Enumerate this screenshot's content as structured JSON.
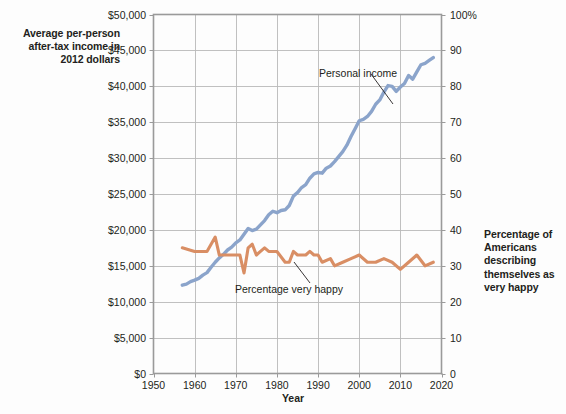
{
  "captions": {
    "left": "Average per-person after-tax income in 2012 dollars",
    "right": "Percentage of Americans describing themselves as very happy"
  },
  "annotations": {
    "personal_income": "Personal income",
    "very_happy": "Percentage very happy"
  },
  "colors": {
    "income_line": "#8ba4cb",
    "happy_line": "#d98e64",
    "grid": "#b9b9b9",
    "frame": "#9a9a9a",
    "text": "#231f20",
    "background": "#fdfdfd"
  },
  "chart_data": {
    "type": "line",
    "title": "",
    "xlabel": "Year",
    "ylabel": "Average per-person after-tax income in 2012 dollars",
    "y2label": "Percentage of Americans describing themselves as very happy",
    "xlim": [
      1950,
      2020
    ],
    "ylim": [
      0,
      50000
    ],
    "y2lim": [
      0,
      100
    ],
    "xticks": [
      1950,
      1960,
      1970,
      1980,
      1990,
      2000,
      2010,
      2020
    ],
    "xticklabels": [
      "1950",
      "1960",
      "1970",
      "1980",
      "1990",
      "2000",
      "2010",
      "2020"
    ],
    "yticks": [
      0,
      5000,
      10000,
      15000,
      20000,
      25000,
      30000,
      35000,
      40000,
      45000,
      50000
    ],
    "yticklabels": [
      "$0",
      "$5,000",
      "$10,000",
      "$15,000",
      "$20,000",
      "$25,000",
      "$30,000",
      "$35,000",
      "$40,000",
      "$45,000",
      "$50,000"
    ],
    "y2ticks": [
      0,
      10,
      20,
      30,
      40,
      50,
      60,
      70,
      80,
      90,
      100
    ],
    "y2ticklabels": [
      "0",
      "10",
      "20",
      "30",
      "40",
      "50",
      "60",
      "70",
      "80",
      "90",
      "100%"
    ],
    "grid": true,
    "legend": "annotations-inline",
    "series": [
      {
        "name": "Personal income",
        "axis": "left",
        "unit": "2012 dollars",
        "color": "#8ba4cb",
        "x": [
          1957,
          1958,
          1959,
          1960,
          1961,
          1962,
          1963,
          1964,
          1965,
          1966,
          1967,
          1968,
          1969,
          1970,
          1971,
          1972,
          1973,
          1974,
          1975,
          1976,
          1977,
          1978,
          1979,
          1980,
          1981,
          1982,
          1983,
          1984,
          1985,
          1986,
          1987,
          1988,
          1989,
          1990,
          1991,
          1992,
          1993,
          1994,
          1995,
          1996,
          1997,
          1998,
          1999,
          2000,
          2001,
          2002,
          2003,
          2004,
          2005,
          2006,
          2007,
          2008,
          2009,
          2010,
          2011,
          2012,
          2013,
          2014,
          2015,
          2016,
          2017,
          2018
        ],
        "values": [
          12300,
          12450,
          12800,
          13000,
          13250,
          13700,
          14050,
          14800,
          15500,
          16100,
          16600,
          17200,
          17600,
          18200,
          18600,
          19400,
          20200,
          19900,
          20100,
          20700,
          21300,
          22100,
          22600,
          22400,
          22700,
          22800,
          23400,
          24700,
          25200,
          25900,
          26300,
          27200,
          27800,
          28000,
          27900,
          28600,
          28900,
          29500,
          30200,
          30900,
          31800,
          33000,
          34100,
          35200,
          35400,
          35800,
          36500,
          37500,
          38100,
          39200,
          40100,
          40000,
          39300,
          39900,
          40400,
          41500,
          41000,
          42000,
          43000,
          43200,
          43600,
          44000
        ]
      },
      {
        "name": "Percentage very happy",
        "axis": "right",
        "unit": "percent",
        "color": "#d98e64",
        "x": [
          1957,
          1960,
          1963,
          1965,
          1966,
          1967,
          1971,
          1972,
          1973,
          1974,
          1975,
          1976,
          1977,
          1978,
          1980,
          1982,
          1983,
          1984,
          1985,
          1986,
          1987,
          1988,
          1989,
          1990,
          1991,
          1993,
          1994,
          1996,
          1998,
          2000,
          2002,
          2004,
          2006,
          2008,
          2010,
          2012,
          2014,
          2016,
          2018
        ],
        "values": [
          35,
          34,
          34,
          38,
          33,
          33,
          33,
          28,
          35,
          36,
          33,
          34,
          35,
          34,
          34,
          31,
          31,
          34,
          33,
          33,
          33,
          34,
          33,
          33,
          31,
          32,
          30,
          31,
          32,
          33,
          31,
          31,
          32,
          31,
          29,
          31,
          33,
          30,
          31
        ]
      }
    ]
  }
}
